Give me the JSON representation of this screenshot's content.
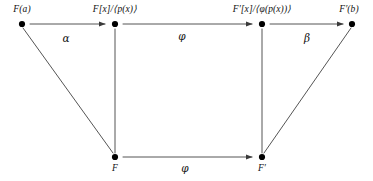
{
  "diagram": {
    "type": "commutative-diagram",
    "title": "",
    "background_color": "#ffffff",
    "stroke_color": "#444444",
    "text_color": "#111111",
    "nodes": [
      {
        "id": "top-left",
        "label": "F(a)",
        "x": 22,
        "y": 24,
        "label_x": 22,
        "label_y": 5
      },
      {
        "id": "top-mid-left",
        "label": "F[x]/⟨p(x)⟩",
        "x": 115,
        "y": 24,
        "label_x": 115,
        "label_y": 5
      },
      {
        "id": "top-mid-right",
        "label": "F′[x]/⟨φ(p(x))⟩",
        "x": 262,
        "y": 24,
        "label_x": 262,
        "label_y": 5
      },
      {
        "id": "top-right",
        "label": "F′(b)",
        "x": 352,
        "y": 24,
        "label_x": 349,
        "label_y": 5
      },
      {
        "id": "bottom-left",
        "label": "F",
        "x": 115,
        "y": 157,
        "label_x": 115,
        "label_y": 164
      },
      {
        "id": "bottom-right",
        "label": "F′",
        "x": 262,
        "y": 157,
        "label_x": 262,
        "label_y": 164
      }
    ],
    "edges": [
      {
        "id": "alpha-edge",
        "from": "top-left",
        "to": "top-mid-left",
        "label": "α",
        "label_x": 66,
        "label_y": 33,
        "arrow": true
      },
      {
        "id": "phi-top-edge",
        "from": "top-mid-left",
        "to": "top-mid-right",
        "label": "φ",
        "label_x": 182,
        "label_y": 31,
        "arrow": true
      },
      {
        "id": "beta-edge",
        "from": "top-mid-right",
        "to": "top-right",
        "label": "β",
        "label_x": 307,
        "label_y": 33,
        "arrow": true
      },
      {
        "id": "phi-bottom-edge",
        "from": "bottom-left",
        "to": "bottom-right",
        "label": "φ",
        "label_x": 185,
        "label_y": 164,
        "arrow": true
      },
      {
        "id": "left-diagonal-edge",
        "from": "top-left",
        "to": "bottom-left",
        "label": "",
        "arrow": false
      },
      {
        "id": "left-vertical-edge",
        "from": "top-mid-left",
        "to": "bottom-left",
        "label": "",
        "arrow": false
      },
      {
        "id": "right-vertical-edge",
        "from": "top-mid-right",
        "to": "bottom-right",
        "label": "",
        "arrow": false
      },
      {
        "id": "right-diagonal-edge",
        "from": "top-right",
        "to": "bottom-right",
        "label": "",
        "arrow": false
      }
    ]
  }
}
